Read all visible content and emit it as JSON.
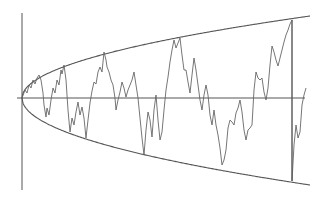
{
  "diagram": {
    "type": "random-walk-with-envelope",
    "background": "#ffffff",
    "stroke_color": "#555555",
    "axes": {
      "vertical": {
        "x": 22,
        "y1": 13,
        "y2": 190
      },
      "horizontal": {
        "y": 98,
        "x1": 17,
        "x2": 305
      }
    },
    "envelope": {
      "origin": [
        22,
        98
      ],
      "upper_end": [
        310,
        16
      ],
      "lower_end": [
        310,
        185
      ]
    },
    "marker_line": {
      "x": 292,
      "y1": 20,
      "y2": 181
    },
    "walk_points": [
      [
        22,
        98
      ],
      [
        25,
        90
      ],
      [
        27,
        93
      ],
      [
        29,
        85
      ],
      [
        31,
        88
      ],
      [
        33,
        80
      ],
      [
        35,
        84
      ],
      [
        37,
        78
      ],
      [
        39,
        75
      ],
      [
        41,
        80
      ],
      [
        43,
        93
      ],
      [
        44,
        105
      ],
      [
        46,
        117
      ],
      [
        47,
        108
      ],
      [
        49,
        115
      ],
      [
        51,
        100
      ],
      [
        53,
        88
      ],
      [
        55,
        93
      ],
      [
        57,
        80
      ],
      [
        59,
        85
      ],
      [
        61,
        70
      ],
      [
        62,
        74
      ],
      [
        64,
        65
      ],
      [
        66,
        80
      ],
      [
        68,
        110
      ],
      [
        70,
        132
      ],
      [
        72,
        118
      ],
      [
        74,
        125
      ],
      [
        76,
        112
      ],
      [
        78,
        102
      ],
      [
        80,
        115
      ],
      [
        82,
        107
      ],
      [
        84,
        118
      ],
      [
        86,
        138
      ],
      [
        88,
        120
      ],
      [
        90,
        103
      ],
      [
        92,
        91
      ],
      [
        94,
        82
      ],
      [
        96,
        84
      ],
      [
        98,
        72
      ],
      [
        100,
        67
      ],
      [
        102,
        72
      ],
      [
        104,
        52
      ],
      [
        106,
        60
      ],
      [
        107,
        67
      ],
      [
        109,
        72
      ],
      [
        111,
        80
      ],
      [
        113,
        85
      ],
      [
        115,
        98
      ],
      [
        116,
        110
      ],
      [
        118,
        100
      ],
      [
        120,
        92
      ],
      [
        122,
        82
      ],
      [
        124,
        88
      ],
      [
        126,
        97
      ],
      [
        128,
        90
      ],
      [
        130,
        85
      ],
      [
        132,
        80
      ],
      [
        134,
        72
      ],
      [
        136,
        85
      ],
      [
        138,
        98
      ],
      [
        140,
        118
      ],
      [
        142,
        138
      ],
      [
        144,
        155
      ],
      [
        146,
        130
      ],
      [
        148,
        112
      ],
      [
        150,
        120
      ],
      [
        152,
        137
      ],
      [
        154,
        110
      ],
      [
        156,
        95
      ],
      [
        158,
        120
      ],
      [
        160,
        140
      ],
      [
        162,
        132
      ],
      [
        164,
        110
      ],
      [
        166,
        90
      ],
      [
        168,
        77
      ],
      [
        170,
        62
      ],
      [
        172,
        50
      ],
      [
        174,
        40
      ],
      [
        176,
        48
      ],
      [
        178,
        43
      ],
      [
        180,
        38
      ],
      [
        182,
        55
      ],
      [
        184,
        70
      ],
      [
        186,
        70
      ],
      [
        188,
        82
      ],
      [
        190,
        93
      ],
      [
        192,
        75
      ],
      [
        194,
        58
      ],
      [
        196,
        70
      ],
      [
        198,
        85
      ],
      [
        200,
        100
      ],
      [
        202,
        110
      ],
      [
        204,
        95
      ],
      [
        206,
        85
      ],
      [
        208,
        95
      ],
      [
        210,
        115
      ],
      [
        212,
        125
      ],
      [
        214,
        110
      ],
      [
        216,
        125
      ],
      [
        218,
        135
      ],
      [
        220,
        148
      ],
      [
        222,
        165
      ],
      [
        224,
        160
      ],
      [
        226,
        150
      ],
      [
        228,
        128
      ],
      [
        230,
        120
      ],
      [
        232,
        122
      ],
      [
        234,
        125
      ],
      [
        236,
        113
      ],
      [
        238,
        108
      ],
      [
        240,
        100
      ],
      [
        242,
        112
      ],
      [
        244,
        130
      ],
      [
        246,
        140
      ],
      [
        248,
        130
      ],
      [
        250,
        128
      ],
      [
        252,
        125
      ],
      [
        254,
        90
      ],
      [
        256,
        72
      ],
      [
        258,
        78
      ],
      [
        260,
        80
      ],
      [
        262,
        78
      ],
      [
        264,
        92
      ],
      [
        266,
        100
      ],
      [
        268,
        88
      ],
      [
        270,
        65
      ],
      [
        272,
        46
      ],
      [
        274,
        52
      ],
      [
        276,
        60
      ],
      [
        278,
        66
      ],
      [
        280,
        58
      ],
      [
        282,
        50
      ],
      [
        284,
        42
      ],
      [
        286,
        35
      ],
      [
        288,
        30
      ],
      [
        290,
        24
      ],
      [
        292,
        20
      ],
      [
        292,
        181
      ],
      [
        294,
        145
      ],
      [
        296,
        125
      ],
      [
        298,
        138
      ],
      [
        300,
        132
      ],
      [
        302,
        105
      ],
      [
        304,
        95
      ],
      [
        306,
        88
      ]
    ]
  }
}
